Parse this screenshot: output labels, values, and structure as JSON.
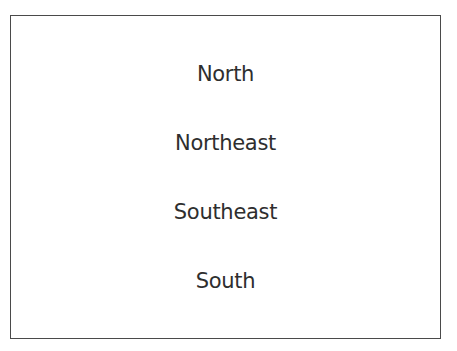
{
  "diagram": {
    "items": [
      {
        "label": "North"
      },
      {
        "label": "Northeast"
      },
      {
        "label": "Southeast"
      },
      {
        "label": "South"
      }
    ],
    "border_color": "#4a4a4a",
    "text_color": "#2e2e2e"
  }
}
